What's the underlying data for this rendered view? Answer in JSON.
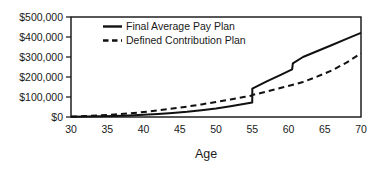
{
  "chart_data": {
    "type": "line",
    "title": "",
    "xlabel": "Age",
    "ylabel": "",
    "xlim": [
      30,
      70
    ],
    "ylim": [
      0,
      500000
    ],
    "grid": false,
    "legend_position": "top-left-inside",
    "x_ticks": [
      30,
      35,
      40,
      45,
      50,
      55,
      60,
      65,
      70
    ],
    "x_tick_labels": [
      "30",
      "35",
      "40",
      "45",
      "50",
      "55",
      "60",
      "65",
      "70"
    ],
    "y_ticks": [
      0,
      100000,
      200000,
      300000,
      400000,
      500000
    ],
    "y_tick_labels": [
      "$0",
      "$100,000",
      "$200,000",
      "$300,000",
      "$400,000",
      "$500,000"
    ],
    "x": [
      30,
      32,
      34,
      36,
      38,
      40,
      42,
      44,
      46,
      48,
      50,
      52,
      54,
      55,
      55.01,
      57,
      59,
      60.5,
      60.6,
      62,
      64,
      66,
      68,
      70
    ],
    "series": [
      {
        "name": "Final Average Pay Plan",
        "style": "solid",
        "color": "#111111",
        "values": [
          1000,
          2000,
          3500,
          5500,
          8000,
          11000,
          15000,
          20000,
          26000,
          34000,
          43000,
          54000,
          66000,
          72000,
          142000,
          178000,
          212000,
          238000,
          268000,
          300000,
          330000,
          360000,
          391000,
          421000
        ]
      },
      {
        "name": "Defined Contribution Plan",
        "style": "dashed",
        "color": "#111111",
        "values": [
          2000,
          4500,
          8000,
          12500,
          18000,
          25000,
          33000,
          42000,
          52000,
          63000,
          75000,
          88000,
          101000,
          108000,
          110000,
          127000,
          146000,
          160000,
          161000,
          175000,
          203000,
          233000,
          272000,
          318000
        ]
      }
    ],
    "annotations": [
      {
        "text": "step increase in Final Average Pay Plan at age 55",
        "x": 55,
        "y_from": 72000,
        "y_to": 142000
      },
      {
        "text": "step increase in Final Average Pay Plan at age 60.5",
        "x": 60.5,
        "y_from": 238000,
        "y_to": 268000
      }
    ]
  },
  "legend": {
    "entries": [
      {
        "label": "Final Average Pay Plan",
        "style": "solid"
      },
      {
        "label": "Defined Contribution Plan",
        "style": "dashed"
      }
    ]
  },
  "colors": {
    "background": "#ffffff",
    "ink": "#111111",
    "text": "#1a1a1a"
  }
}
